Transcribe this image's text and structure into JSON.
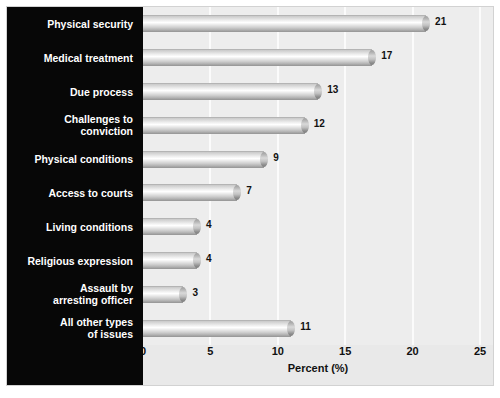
{
  "chart_data": {
    "type": "bar",
    "orientation": "horizontal",
    "title": "",
    "subtitle": "",
    "xlabel": "Percent (%)",
    "ylabel": "",
    "xlim": [
      0,
      25
    ],
    "xticks": [
      0,
      5,
      10,
      15,
      20,
      25
    ],
    "xtick_labels": [
      "0",
      "5",
      "10",
      "15",
      "20",
      "25"
    ],
    "grid": "vertical",
    "legend": "none",
    "categories": [
      "Physical security",
      "Medical treatment",
      "Due process",
      "Challenges to\nconviction",
      "Physical conditions",
      "Access to courts",
      "Living conditions",
      "Religious expression",
      "Assault by\narresting officer",
      "All other types\nof issues"
    ],
    "values": [
      21,
      17,
      13,
      12,
      9,
      7,
      4,
      4,
      3,
      11
    ],
    "value_labels": [
      "21",
      "17",
      "13",
      "12",
      "9",
      "7",
      "4",
      "4",
      "3",
      "11"
    ],
    "colors": {
      "bar_light": "#ffffff",
      "bar_mid": "#d8d8d8",
      "bar_dark": "#9a9a9a",
      "plot_background": "#ededed",
      "label_panel_background": "#070707",
      "label_text": "#ffffff",
      "axis_text": "#111111",
      "gridline": "#fbfbfb",
      "figure_background": "#ffffff"
    }
  }
}
